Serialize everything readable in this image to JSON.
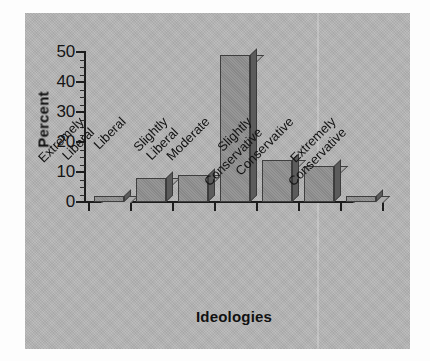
{
  "chart_data": {
    "type": "bar",
    "title": "",
    "xlabel": "Ideologies",
    "ylabel": "Percent",
    "categories": [
      "Extremely Liberal",
      "Liberal",
      "Slightly Liberal",
      "Moderate",
      "Slightly Conservative",
      "Conservative",
      "Extremely Conservative"
    ],
    "category_lines": [
      [
        "Extremely",
        "Liberal"
      ],
      [
        "Liberal",
        ""
      ],
      [
        "Slightly",
        "Liberal"
      ],
      [
        "Moderate",
        ""
      ],
      [
        "Slightly",
        "Conservative"
      ],
      [
        "Conservative",
        ""
      ],
      [
        "Extremely",
        "Conservative"
      ]
    ],
    "values": [
      2,
      8,
      9,
      49,
      14,
      12,
      2
    ],
    "ylim": [
      0,
      50
    ],
    "ytick_values": [
      0,
      10,
      20,
      30,
      40,
      50
    ],
    "ytick_labels": [
      "0",
      "10",
      "20",
      "30",
      "40",
      "50"
    ],
    "yminor_step": 2.5,
    "grid": false,
    "legend": false,
    "bar_style": "3d-block"
  },
  "colors": {
    "panel_background": "#b6b6b6",
    "page_background": "#fdfdfd",
    "bar_front": "#8f8f8f",
    "bar_top": "#ababab",
    "bar_side": "#5c5c5c",
    "axis": "#1c1c1c",
    "text": "#101010"
  },
  "axes": {
    "y_title": "Percent",
    "x_title": "Ideologies"
  }
}
